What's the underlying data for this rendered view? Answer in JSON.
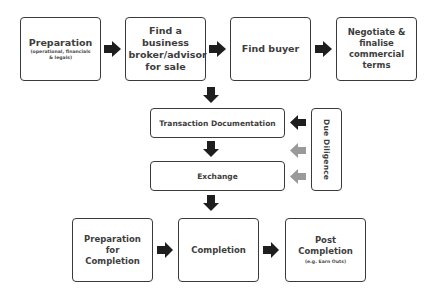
{
  "diagram": {
    "row1": [
      {
        "title": "Preparation",
        "subtitle": "(operational, financials & legals)"
      },
      {
        "title": "Find a business broker/advisor for sale"
      },
      {
        "title": "Find buyer"
      },
      {
        "title": "Negotiate & finalise commercial terms"
      }
    ],
    "middle": {
      "transaction": "Transaction Documentation",
      "exchange": "Exchange",
      "due_diligence": "Due Diligence"
    },
    "row3": [
      {
        "title": "Preparation for Completion"
      },
      {
        "title": "Completion"
      },
      {
        "title": "Post Completion",
        "subtitle": "(e.g. Earn Outs)"
      }
    ]
  },
  "colors": {
    "arrow_primary": "#1e1e1e",
    "arrow_secondary": "#9a9a9a",
    "border": "#3a3a3a"
  }
}
